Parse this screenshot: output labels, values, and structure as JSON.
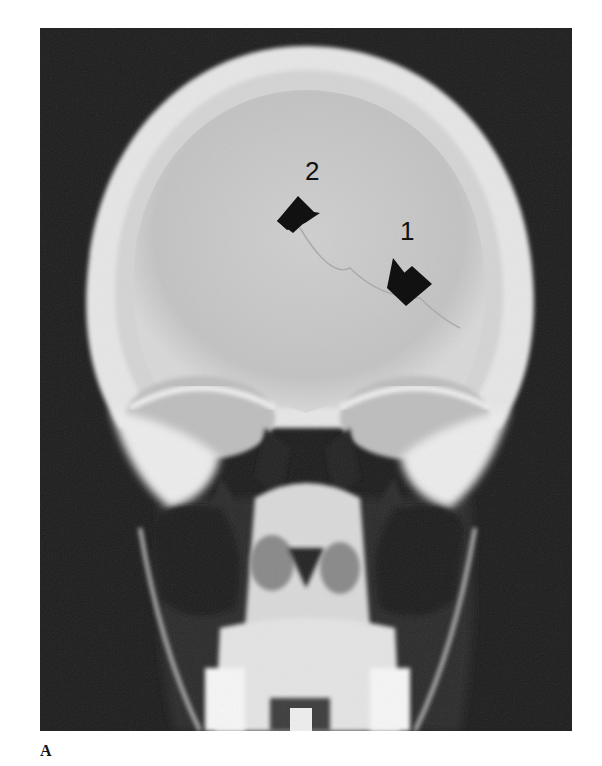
{
  "figure": {
    "panel_label": "A",
    "annotations": [
      {
        "id": "arrow-1",
        "label": "1"
      },
      {
        "id": "arrow-2",
        "label": "2"
      }
    ],
    "colors": {
      "background": "#1c1c1c",
      "bone": "#e8e8e8",
      "vault_interior": "#c9c9c9",
      "arrow": "#111111"
    }
  }
}
